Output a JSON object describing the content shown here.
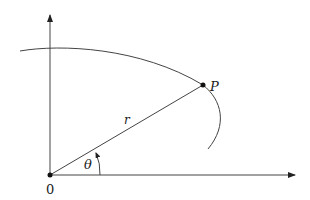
{
  "figure": {
    "type": "polar-coordinates-diagram",
    "colors": {
      "stroke": "#333333",
      "text": "#1a1a1a",
      "background": "#ffffff"
    },
    "labels": {
      "origin": "0",
      "point": "P",
      "radius": "r",
      "angle": "θ"
    },
    "elements": {
      "x_axis": "horizontal axis with arrow",
      "y_axis": "vertical axis with arrow",
      "curve": "curve passing through P",
      "radius_segment": "segment from origin to P",
      "angle_arc": "arc with arrow indicating angle θ"
    }
  }
}
